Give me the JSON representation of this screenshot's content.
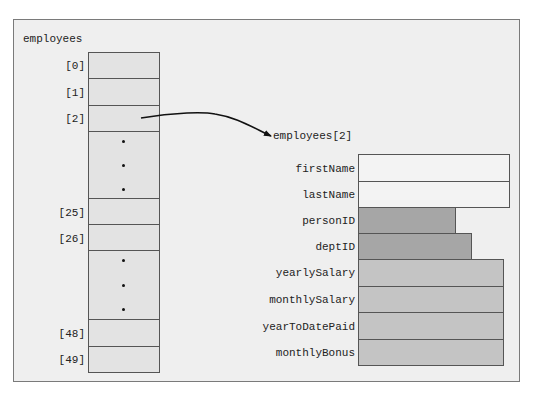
{
  "array": {
    "name": "employees",
    "cells": [
      {
        "index": "[0]",
        "kind": "cell"
      },
      {
        "index": "[1]",
        "kind": "cell"
      },
      {
        "index": "[2]",
        "kind": "cell"
      },
      {
        "index": "",
        "kind": "ellipsis"
      },
      {
        "index": "[25]",
        "kind": "cell"
      },
      {
        "index": "[26]",
        "kind": "cell"
      },
      {
        "index": "",
        "kind": "ellipsis"
      },
      {
        "index": "[48]",
        "kind": "cell"
      },
      {
        "index": "[49]",
        "kind": "cell"
      }
    ]
  },
  "struct": {
    "title": "employees[2]",
    "fields": [
      {
        "name": "firstName",
        "width_rel": "long",
        "color": "#f3f3f3"
      },
      {
        "name": "lastName",
        "width_rel": "long",
        "color": "#f3f3f3"
      },
      {
        "name": "personID",
        "width_rel": "short",
        "color": "#a6a6a6"
      },
      {
        "name": "deptID",
        "width_rel": "medium",
        "color": "#a6a6a6"
      },
      {
        "name": "yearlySalary",
        "width_rel": "wide",
        "color": "#c4c4c4"
      },
      {
        "name": "monthlySalary",
        "width_rel": "wide",
        "color": "#c4c4c4"
      },
      {
        "name": "yearToDatePaid",
        "width_rel": "wide",
        "color": "#c4c4c4"
      },
      {
        "name": "monthlyBonus",
        "width_rel": "wide",
        "color": "#c4c4c4"
      }
    ]
  },
  "colors": {
    "frame_bg": "#efefef",
    "array_cell": "#e3e3e3",
    "string_field": "#f3f3f3",
    "int_field": "#a6a6a6",
    "double_field": "#c4c4c4"
  }
}
